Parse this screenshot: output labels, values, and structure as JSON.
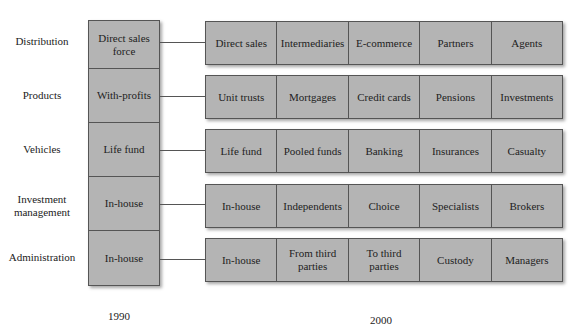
{
  "diagram": {
    "categories": [
      {
        "label": "Distribution",
        "y1990": "Direct sales force",
        "items2000": [
          "Direct sales",
          "Intermediaries",
          "E-commerce",
          "Partners",
          "Agents"
        ]
      },
      {
        "label": "Products",
        "y1990": "With-profits",
        "items2000": [
          "Unit trusts",
          "Mortgages",
          "Credit cards",
          "Pensions",
          "Investments"
        ]
      },
      {
        "label": "Vehicles",
        "y1990": "Life fund",
        "items2000": [
          "Life fund",
          "Pooled funds",
          "Banking",
          "Insurances",
          "Casualty"
        ]
      },
      {
        "label": "Investment management",
        "y1990": "In-house",
        "items2000": [
          "In-house",
          "Independents",
          "Choice",
          "Specialists",
          "Brokers"
        ]
      },
      {
        "label": "Administration",
        "y1990": "In-house",
        "items2000": [
          "In-house",
          "From third parties",
          "To third parties",
          "Custody",
          "Managers"
        ]
      }
    ],
    "year_labels": {
      "left": "1990",
      "right": "2000"
    },
    "colors": {
      "box_fill": "#b4b4b4",
      "border": "#555555"
    }
  }
}
